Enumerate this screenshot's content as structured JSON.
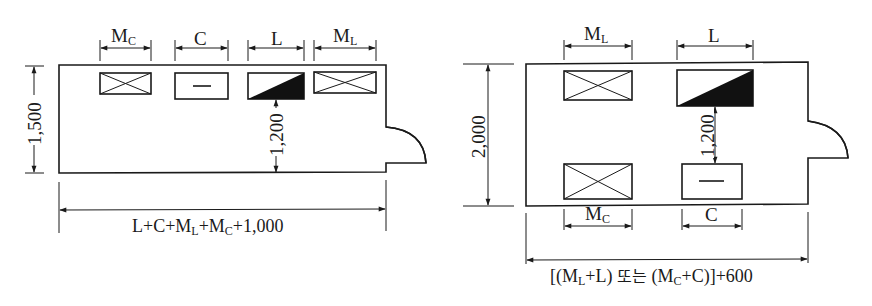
{
  "left_layout": {
    "fixtures_top_row": [
      {
        "id": "mc",
        "label_main": "M",
        "label_sub": "C",
        "symbol": "urinal-cross-box"
      },
      {
        "id": "c",
        "label_main": "C",
        "label_sub": "",
        "symbol": "toilet-dash-box"
      },
      {
        "id": "l",
        "label_main": "L",
        "label_sub": "",
        "symbol": "lavatory-half-filled-box"
      },
      {
        "id": "ml",
        "label_main": "M",
        "label_sub": "L",
        "symbol": "urinal-cross-box"
      }
    ],
    "height_dimension": "1,500",
    "clearance_dimension": "1,200",
    "width_formula": {
      "p1": "L+C+M",
      "s1": "L",
      "p2": "+M",
      "s2": "C",
      "p3": "+1,000"
    }
  },
  "right_layout": {
    "fixtures_top_row": [
      {
        "id": "ml",
        "label_main": "M",
        "label_sub": "L",
        "symbol": "urinal-cross-box"
      },
      {
        "id": "l",
        "label_main": "L",
        "label_sub": "",
        "symbol": "lavatory-half-filled-box"
      }
    ],
    "fixtures_bottom_row": [
      {
        "id": "mc",
        "label_main": "M",
        "label_sub": "C",
        "symbol": "urinal-cross-box"
      },
      {
        "id": "c",
        "label_main": "C",
        "label_sub": "",
        "symbol": "toilet-dash-box"
      }
    ],
    "height_dimension": "2,000",
    "clearance_dimension": "1,200",
    "width_formula": {
      "p1": "[(M",
      "s1": "L",
      "p2": "+L) ",
      "korean": "또는",
      "p3": " (M",
      "s2": "C",
      "p4": "+C)]+600"
    }
  },
  "colors": {
    "line": "#1a1a1a",
    "background": "#ffffff"
  }
}
